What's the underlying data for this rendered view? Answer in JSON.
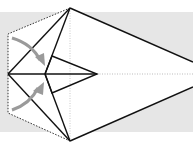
{
  "diagram": {
    "title": "",
    "type": "origami-fold-step",
    "colors": {
      "background": "#ffffff",
      "paper_back": "#e4e4e4",
      "crease": "#111111",
      "hidden_edge": "#333333",
      "arrow": "#9a9a9a",
      "reference_line": "#bbbbbb"
    },
    "arrows": [
      {
        "name": "fold-arrow-upper",
        "direction": "down-right"
      },
      {
        "name": "fold-arrow-lower",
        "direction": "up-right"
      }
    ]
  }
}
